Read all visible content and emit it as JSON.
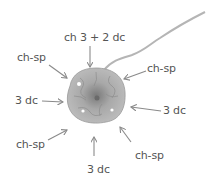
{
  "diagram": {
    "colors": {
      "label": "#555555",
      "arrow": "#8a8a8a",
      "yarn": "#b5b5b5",
      "motif": "#9a9a9a",
      "background": "#ffffff"
    },
    "labels": {
      "top": "ch 3 + 2 dc",
      "top_left": "ch-sp",
      "top_right": "ch-sp",
      "left": "3 dc",
      "right": "3 dc",
      "bottom_left": "ch-sp",
      "bottom_right": "ch-sp",
      "bottom": "3 dc"
    }
  }
}
